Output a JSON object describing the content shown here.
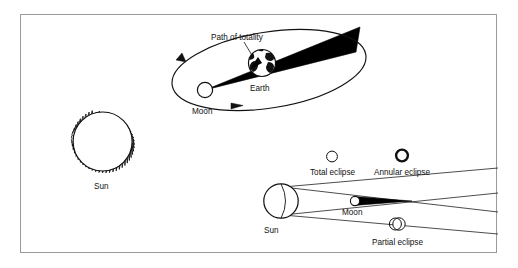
{
  "figure": {
    "background_color": "#ffffff",
    "border_color": "#9a9a9a",
    "ink_color": "#000000",
    "panels": [
      {
        "name": "orbit-panel",
        "description": "Moon orbiting Earth with umbra cone reaching Earth's surface",
        "labels": [
          "Path of totality",
          "Earth",
          "Moon"
        ]
      },
      {
        "name": "sun-corona-panel",
        "description": "Sun drawn as a circle with jagged corona spikes",
        "labels": [
          "Sun"
        ]
      },
      {
        "name": "eclipse-types-panel",
        "description": "Sun and Moon with tangent shadow lines producing total, annular and partial eclipse views",
        "labels": [
          "Total eclipse",
          "Annular eclipse",
          "Sun",
          "Moon",
          "Partial eclipse"
        ]
      }
    ]
  },
  "orbit_panel": {
    "path_of_totality_label": "Path of totality",
    "earth_label": "Earth",
    "moon_label": "Moon"
  },
  "sun_panel": {
    "sun_label": "Sun"
  },
  "eclipse_panel": {
    "total_eclipse_label": "Total eclipse",
    "annular_eclipse_label": "Annular eclipse",
    "partial_eclipse_label": "Partial eclipse",
    "sun_label": "Sun",
    "moon_label": "Moon"
  }
}
